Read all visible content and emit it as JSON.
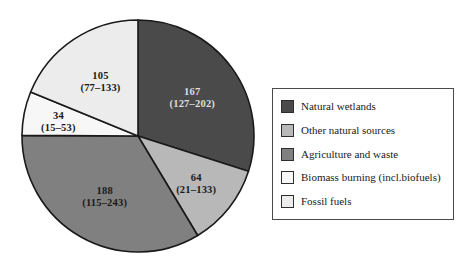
{
  "chart_data": {
    "type": "pie",
    "title": "",
    "subtitle": "",
    "xlabel": "",
    "ylabel": "",
    "units": "Tg CH4 per year",
    "total": 558,
    "start_angle_deg": 0,
    "direction": "clockwise",
    "grid": false,
    "legend_position": "right",
    "categories": [
      "Natural wetlands",
      "Other natural sources",
      "Agriculture and waste",
      "Biomass burning (incl.biofuels)",
      "Fossil fuels"
    ],
    "values": [
      167,
      64,
      188,
      34,
      105
    ],
    "ranges": [
      [
        127,
        202
      ],
      [
        21,
        133
      ],
      [
        115,
        243
      ],
      [
        15,
        53
      ],
      [
        77,
        133
      ]
    ],
    "colors": [
      "#4a4a4a",
      "#b8b8b8",
      "#808080",
      "#f7f7f7",
      "#ececec"
    ],
    "slices": [
      {
        "label": "Natural wetlands",
        "value": 167,
        "value_text": "167",
        "range_text": "(127–202)",
        "range_low": 127,
        "range_high": 202,
        "color": "#4a4a4a",
        "angle_deg": 107.7,
        "label_text_color": "light"
      },
      {
        "label": "Other natural sources",
        "value": 64,
        "value_text": "64",
        "range_text": "(21–133)",
        "range_low": 21,
        "range_high": 133,
        "color": "#b8b8b8",
        "angle_deg": 41.3,
        "label_text_color": "dark"
      },
      {
        "label": "Agriculture and waste",
        "value": 188,
        "value_text": "188",
        "range_text": "(115–243)",
        "range_low": 115,
        "range_high": 243,
        "color": "#808080",
        "angle_deg": 121.3,
        "label_text_color": "dark"
      },
      {
        "label": "Biomass burning (incl.biofuels)",
        "value": 34,
        "value_text": "34",
        "range_text": "(15–53)",
        "range_low": 15,
        "range_high": 53,
        "color": "#f7f7f7",
        "angle_deg": 21.9,
        "label_text_color": "dark"
      },
      {
        "label": "Fossil fuels",
        "value": 105,
        "value_text": "105",
        "range_text": "(77–133)",
        "range_low": 77,
        "range_high": 133,
        "color": "#ececec",
        "angle_deg": 67.7,
        "label_text_color": "dark"
      }
    ]
  },
  "legend": {
    "items": [
      {
        "label": "Natural wetlands",
        "color": "#4a4a4a"
      },
      {
        "label": "Other natural sources",
        "color": "#b8b8b8"
      },
      {
        "label": "Agriculture and waste",
        "color": "#808080"
      },
      {
        "label": "Biomass burning (incl.biofuels)",
        "color": "#f7f7f7"
      },
      {
        "label": "Fossil fuels",
        "color": "#ececec"
      }
    ]
  }
}
